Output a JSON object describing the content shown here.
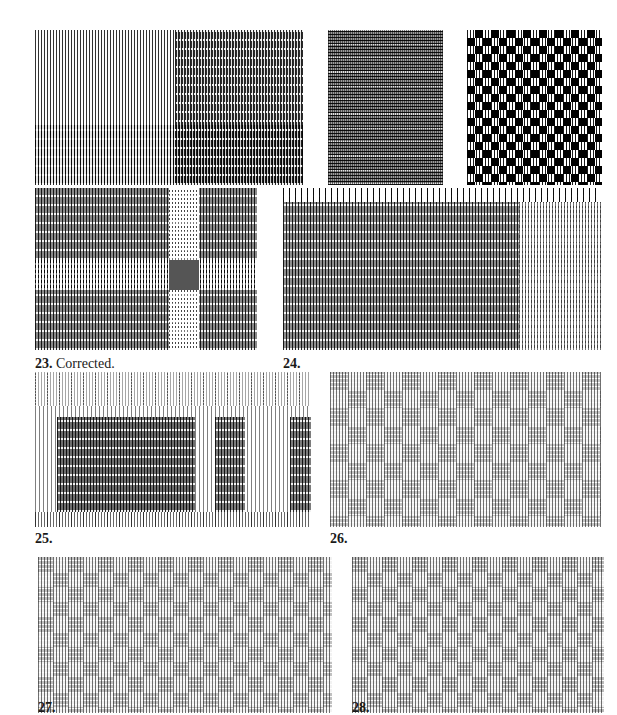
{
  "page": {
    "background": "#ffffff",
    "ink": "#1a1a1a"
  },
  "figures": [
    {
      "id": "fig-21",
      "number": "21.",
      "caption": "",
      "x": 35,
      "y": 30,
      "w": 268,
      "h": 155,
      "pattern": "check"
    },
    {
      "id": "fig-22a",
      "number": "22.",
      "caption": " Treadled as M's & O's.",
      "x": 328,
      "y": 30,
      "w": 115,
      "h": 155,
      "pattern": "dense"
    },
    {
      "id": "fig-22b",
      "number": "22.",
      "caption": " Treadled as overshot.",
      "x": 467,
      "y": 30,
      "w": 135,
      "h": 155,
      "pattern": "bw-check"
    },
    {
      "id": "fig-23",
      "number": "23.",
      "caption": " Corrected.",
      "x": 35,
      "y": 188,
      "w": 222,
      "h": 162,
      "pattern": "weave-a"
    },
    {
      "id": "fig-24",
      "number": "24.",
      "caption": "",
      "x": 283,
      "y": 188,
      "w": 318,
      "h": 162,
      "pattern": "weave-a"
    },
    {
      "id": "fig-25",
      "number": "25.",
      "caption": "",
      "x": 35,
      "y": 372,
      "w": 276,
      "h": 155,
      "pattern": "weave-a"
    },
    {
      "id": "fig-26",
      "number": "26.",
      "caption": "",
      "x": 330,
      "y": 372,
      "w": 271,
      "h": 155,
      "pattern": "sparse"
    },
    {
      "id": "fig-27",
      "number": "27.",
      "caption": "",
      "x": 38,
      "y": 557,
      "w": 294,
      "h": 156,
      "pattern": "sparse"
    },
    {
      "id": "fig-28",
      "number": "28.",
      "caption": "",
      "x": 352,
      "y": 557,
      "w": 252,
      "h": 156,
      "pattern": "sparse"
    }
  ],
  "captions": [
    {
      "number": "21.",
      "text": "",
      "x": 35,
      "y": 191
    },
    {
      "number": "22.",
      "text": " Treadled as M's & O's.",
      "x": 310,
      "y": 191
    },
    {
      "number": "22.",
      "text": " Treadled as overshot.",
      "x": 450,
      "y": 191
    },
    {
      "number": "23.",
      "text": " Corrected.",
      "x": 35,
      "y": 356
    },
    {
      "number": "24.",
      "text": "",
      "x": 283,
      "y": 356
    },
    {
      "number": "25.",
      "text": "",
      "x": 35,
      "y": 531
    },
    {
      "number": "26.",
      "text": "",
      "x": 330,
      "y": 531
    },
    {
      "number": "27.",
      "text": "",
      "x": 38,
      "y": 700
    },
    {
      "number": "28.",
      "text": "",
      "x": 352,
      "y": 700
    }
  ]
}
